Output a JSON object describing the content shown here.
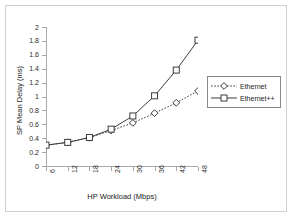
{
  "chart_data": {
    "type": "line",
    "title": "",
    "xlabel": "HP Workload (Mbps)",
    "ylabel": "SP Mean Delay (ms)",
    "x": [
      6,
      12,
      18,
      24,
      30,
      36,
      42,
      48
    ],
    "xlim": [
      6,
      48
    ],
    "ylim": [
      0,
      2
    ],
    "xticks": [
      "6",
      "12",
      "18",
      "24",
      "30",
      "36",
      "42",
      "48"
    ],
    "yticks": [
      "0",
      "0.2",
      "0.4",
      "0.6",
      "0.8",
      "1",
      "1.2",
      "1.4",
      "1.6",
      "1.8",
      "2"
    ],
    "grid": false,
    "legend_position": "right",
    "series": [
      {
        "name": "Ethernet",
        "marker": "diamond",
        "line_style": "dotted",
        "color": "#3c3c3c",
        "values": [
          0.3,
          0.34,
          0.41,
          0.51,
          0.62,
          0.76,
          0.91,
          1.08
        ]
      },
      {
        "name": "Ethernet++",
        "marker": "square",
        "line_style": "solid",
        "color": "#3c3c3c",
        "values": [
          0.3,
          0.34,
          0.41,
          0.53,
          0.72,
          1.01,
          1.38,
          1.81
        ]
      }
    ]
  },
  "legend": {
    "items": [
      {
        "label": "Ethernet"
      },
      {
        "label": "Ethernet++"
      }
    ]
  },
  "colors": {
    "frame": "#cfcfcf",
    "axis": "#a9a9a9",
    "series": "#3c3c3c",
    "background": "#ffffff"
  }
}
